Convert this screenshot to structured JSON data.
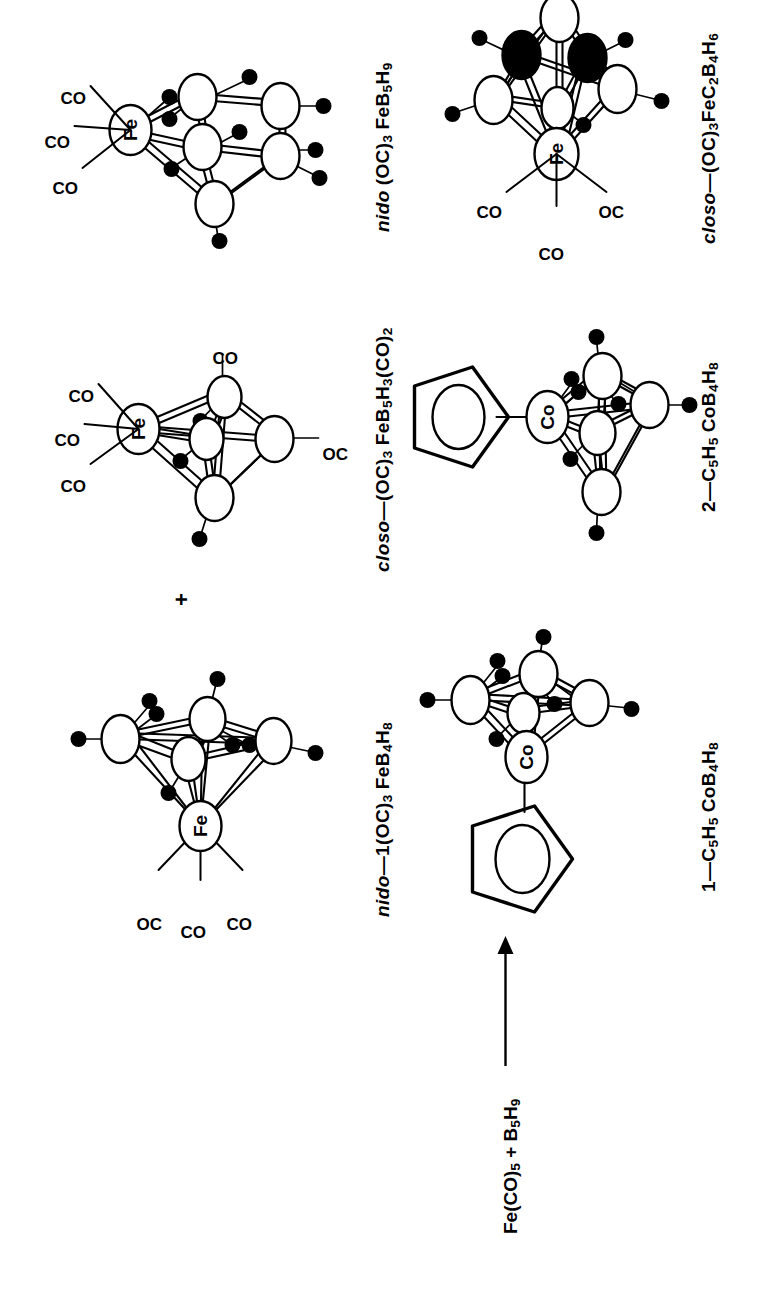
{
  "figure": {
    "kind": "reaction-scheme",
    "orientation": "rotated 90 degrees counter-clockwise on the page",
    "background": "#ffffff",
    "ink": "#000000"
  },
  "reaction": {
    "reactants_text": "Fe(CO)5 + B5H9",
    "reactants_parts": [
      {
        "t": "Fe(CO)"
      },
      {
        "sub": "5"
      },
      {
        "t": " + B"
      },
      {
        "sub": "5"
      },
      {
        "t": "H"
      },
      {
        "sub": "9"
      }
    ],
    "arrow": "right-arrow",
    "plus_symbol": "+"
  },
  "structures": [
    {
      "id": "closo-FeC2B4H6",
      "label_prefix_italic": "closo",
      "label_dash": "—",
      "label_formula_parts": [
        {
          "t": "(OC)"
        },
        {
          "sub": "3"
        },
        {
          "t": "FeC"
        },
        {
          "sub": "2"
        },
        {
          "t": "B"
        },
        {
          "sub": "4"
        },
        {
          "t": "H"
        },
        {
          "sub": "6"
        }
      ],
      "label_plain": "closo—(OC)3FeC2B4H6",
      "metal_atom": "Fe",
      "ligand_labels": [
        "OC",
        "CO",
        "CO"
      ],
      "open_vertices": 4,
      "filled_vertices": 2,
      "terminal_h_count": 6
    },
    {
      "id": "2-C5H5CoB4H8",
      "label_prefix_plain": "2",
      "label_dash": "—",
      "label_formula_parts": [
        {
          "t": "C"
        },
        {
          "sub": "5"
        },
        {
          "t": "H"
        },
        {
          "sub": "5"
        },
        {
          "t": "CoB"
        },
        {
          "sub": "4"
        },
        {
          "t": "H"
        },
        {
          "sub": "8"
        }
      ],
      "label_plain": "2—C5H5CoB4H8",
      "metal_atom": "Co",
      "ligand_labels": [
        "C5H5 (cyclopentadienyl)"
      ],
      "cp_position": "apical-top",
      "open_vertices": 4,
      "terminal_h_count": 8
    },
    {
      "id": "1-C5H5CoB4H8",
      "label_prefix_plain": "1",
      "label_dash": "—",
      "label_formula_parts": [
        {
          "t": "C"
        },
        {
          "sub": "5"
        },
        {
          "t": "H"
        },
        {
          "sub": "5"
        },
        {
          "t": "CoB"
        },
        {
          "sub": "4"
        },
        {
          "t": "H"
        },
        {
          "sub": "8"
        }
      ],
      "label_plain": "1—C5H5CoB4H8",
      "metal_atom": "Co",
      "ligand_labels": [
        "C5H5 (cyclopentadienyl)"
      ],
      "cp_position": "side-left",
      "open_vertices": 4,
      "terminal_h_count": 8
    },
    {
      "id": "nido-FeB5H9",
      "label_prefix_italic": "nido",
      "label_dash": " ",
      "label_formula_parts": [
        {
          "t": "(OC)"
        },
        {
          "sub": "3"
        },
        {
          "t": " FeB"
        },
        {
          "sub": "5"
        },
        {
          "t": "H"
        },
        {
          "sub": "9"
        }
      ],
      "label_plain": "nido (OC)3 FeB5H9",
      "metal_atom": "Fe",
      "ligand_labels": [
        "CO",
        "CO",
        "CO"
      ],
      "open_vertices": 5,
      "terminal_h_count": 9
    },
    {
      "id": "closo-FeB5H3-CO2",
      "label_prefix_italic": "closo",
      "label_dash": "—",
      "label_formula_parts": [
        {
          "t": "(OC)"
        },
        {
          "sub": "3"
        },
        {
          "t": " FeB"
        },
        {
          "sub": "5"
        },
        {
          "t": "H"
        },
        {
          "sub": "3"
        },
        {
          "t": "(CO)"
        },
        {
          "sub": "2"
        }
      ],
      "label_plain": "closo—(OC)3 FeB5H3(CO)2",
      "metal_atom": "Fe",
      "ligand_labels": [
        "CO",
        "CO",
        "CO",
        "CO",
        "OC"
      ],
      "open_vertices": 5,
      "terminal_h_count": 3
    },
    {
      "id": "nido-1-FeB4H8",
      "label_prefix_italic": "nido",
      "label_dash": "—",
      "label_number": "1",
      "label_formula_parts": [
        {
          "t": "(OC)"
        },
        {
          "sub": "3"
        },
        {
          "t": " FeB"
        },
        {
          "sub": "4"
        },
        {
          "t": "H"
        },
        {
          "sub": "8"
        }
      ],
      "label_plain": "nido—1(OC)3 FeB4H8",
      "metal_atom": "Fe",
      "ligand_labels": [
        "OC",
        "CO",
        "CO"
      ],
      "open_vertices": 4,
      "terminal_h_count": 8
    }
  ],
  "ligand_text": {
    "oc": "OC",
    "co": "CO"
  }
}
